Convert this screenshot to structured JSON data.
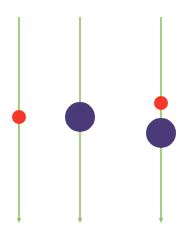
{
  "diagram": {
    "canvas": {
      "width": 186,
      "height": 233,
      "background": "#ffffff"
    },
    "colors": {
      "line": "#8cc462",
      "small_dot": "#f5382a",
      "large_dot": "#4b3a78"
    },
    "lines": [
      {
        "x": 19,
        "y_start": 17,
        "y_end": 222
      },
      {
        "x": 80,
        "y_start": 17,
        "y_end": 222
      },
      {
        "x": 161,
        "y_start": 17,
        "y_end": 222
      }
    ],
    "dots": [
      {
        "line": 0,
        "cx": 19,
        "cy": 117,
        "r": 7,
        "kind": "small_dot"
      },
      {
        "line": 1,
        "cx": 80,
        "cy": 117,
        "r": 15,
        "kind": "large_dot"
      },
      {
        "line": 2,
        "cx": 161,
        "cy": 103,
        "r": 7,
        "kind": "small_dot"
      },
      {
        "line": 2,
        "cx": 161,
        "cy": 133,
        "r": 15,
        "kind": "large_dot"
      }
    ]
  }
}
